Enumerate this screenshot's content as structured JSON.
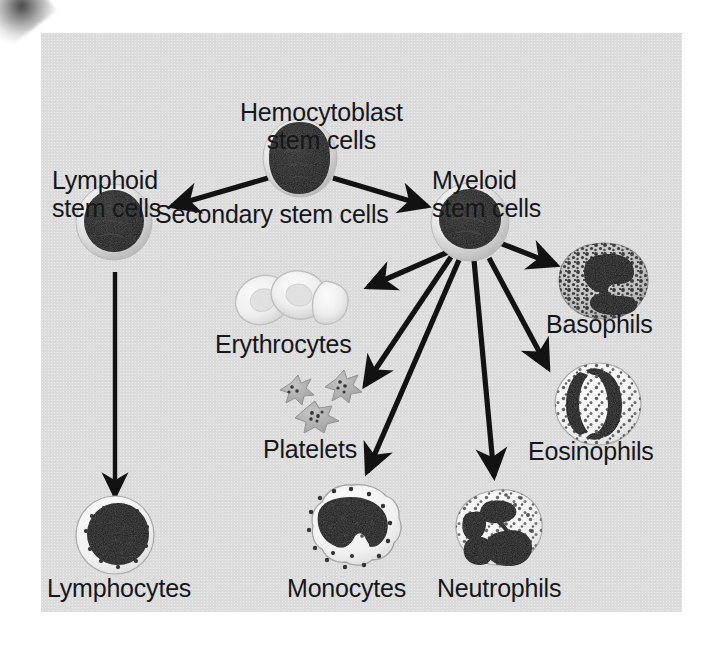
{
  "diagram": {
    "type": "flow-diagram",
    "panel_background": "#dcdcdc",
    "ink_color": "#15171a",
    "labels": {
      "hemocytoblast": "Hemocytoblast\nstem cells",
      "lymphoid": "Lymphoid\nstem cells",
      "myeloid": "Myeloid\nstem cells",
      "secondary": "Secondary stem cells",
      "erythrocytes": "Erythrocytes",
      "platelets": "Platelets",
      "basophils": "Basophils",
      "eosinophils": "Eosinophils",
      "lymphocytes": "Lymphocytes",
      "monocytes": "Monocytes",
      "neutrophils": "Neutrophils"
    },
    "nodes": [
      {
        "id": "hemocytoblast",
        "label": "Hemocytoblast stem cells",
        "x": 300,
        "y": 158,
        "r": 37,
        "kind": "stem-cell"
      },
      {
        "id": "lymphoid",
        "label": "Lymphoid stem cells",
        "x": 114,
        "y": 222,
        "r": 37,
        "kind": "stem-cell"
      },
      {
        "id": "myeloid",
        "label": "Myeloid stem cells",
        "x": 470,
        "y": 222,
        "r": 37,
        "kind": "stem-cell"
      },
      {
        "id": "erythrocytes",
        "label": "Erythrocytes",
        "x": 288,
        "y": 296,
        "r": 34,
        "kind": "erythrocyte-cluster"
      },
      {
        "id": "platelets",
        "label": "Platelets",
        "x": 318,
        "y": 404,
        "r": 24,
        "kind": "platelet-cluster"
      },
      {
        "id": "basophils",
        "label": "Basophils",
        "x": 604,
        "y": 281,
        "r": 38,
        "kind": "granulocyte-dark"
      },
      {
        "id": "eosinophils",
        "label": "Eosinophils",
        "x": 598,
        "y": 404,
        "r": 40,
        "kind": "granulocyte-light"
      },
      {
        "id": "lymphocytes",
        "label": "Lymphocytes",
        "x": 115,
        "y": 535,
        "r": 38,
        "kind": "lymphocyte"
      },
      {
        "id": "monocytes",
        "label": "Monocytes",
        "x": 352,
        "y": 528,
        "r": 43,
        "kind": "monocyte"
      },
      {
        "id": "neutrophils",
        "label": "Neutrophils",
        "x": 496,
        "y": 532,
        "r": 42,
        "kind": "neutrophil"
      }
    ],
    "edges": [
      {
        "from": "hemocytoblast",
        "to": "lymphoid",
        "kind": "arrow"
      },
      {
        "from": "hemocytoblast",
        "to": "myeloid",
        "kind": "arrow"
      },
      {
        "from": "lymphoid",
        "to": "lymphocytes",
        "kind": "arrow"
      },
      {
        "from": "myeloid",
        "to": "erythrocytes",
        "kind": "arrow"
      },
      {
        "from": "myeloid",
        "to": "platelets",
        "kind": "arrow"
      },
      {
        "from": "myeloid",
        "to": "monocytes",
        "kind": "arrow"
      },
      {
        "from": "myeloid",
        "to": "neutrophils",
        "kind": "arrow"
      },
      {
        "from": "myeloid",
        "to": "basophils",
        "kind": "arrow"
      },
      {
        "from": "myeloid",
        "to": "eosinophils",
        "kind": "arrow"
      }
    ]
  }
}
